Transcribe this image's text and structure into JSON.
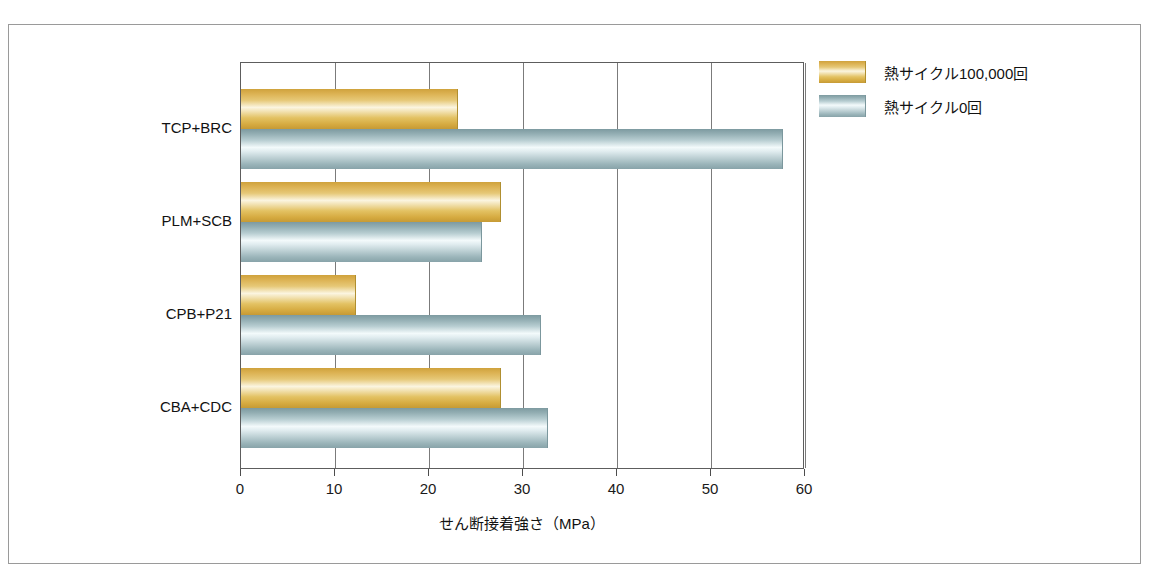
{
  "chart_data": {
    "type": "bar",
    "orientation": "horizontal",
    "title": "",
    "xlabel": "せん断接着強さ（MPa）",
    "ylabel": "",
    "xlim": [
      0,
      60
    ],
    "xticks": [
      0,
      10,
      20,
      30,
      40,
      50,
      60
    ],
    "xtick_labels": [
      "0",
      "10",
      "20",
      "30",
      "40",
      "50",
      "60"
    ],
    "grid": true,
    "grid_axis": "x",
    "legend_position": "right",
    "categories": [
      "TCP+BRC",
      "PLM+SCB",
      "CPB+P21",
      "CBA+CDC"
    ],
    "series": [
      {
        "name": "熱サイクル100,000回",
        "color": "#dcb253",
        "values": [
          23.0,
          27.6,
          12.1,
          27.6
        ]
      },
      {
        "name": "熱サイクル0回",
        "color": "#a8c2c7",
        "values": [
          57.6,
          25.5,
          31.8,
          32.5
        ]
      }
    ]
  },
  "legend": {
    "items": [
      {
        "label": "熱サイクル100,000回",
        "swatch": "gold-gradient-swatch"
      },
      {
        "label": "熱サイクル0回",
        "swatch": "blue-gradient-swatch"
      }
    ]
  },
  "axis": {
    "x_title": "せん断接着強さ（MPa）",
    "ticks": [
      "0",
      "10",
      "20",
      "30",
      "40",
      "50",
      "60"
    ]
  },
  "categories": [
    "TCP+BRC",
    "PLM+SCB",
    "CPB+P21",
    "CBA+CDC"
  ]
}
